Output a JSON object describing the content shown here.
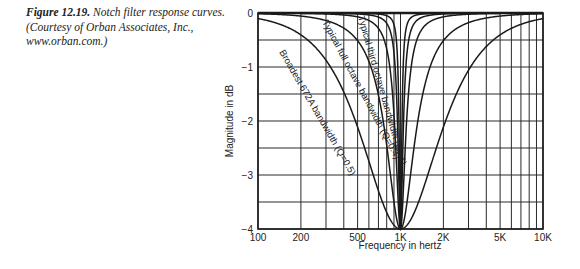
{
  "caption": {
    "figure_number": "Figure 12.19.",
    "text_line1": " Notch filter response curves.",
    "text_line2": "(Courtesy of Orban Associates, Inc.,",
    "text_line3": "www.orban.com.)"
  },
  "chart_data": {
    "type": "line",
    "title": "Notch filter response curves",
    "xlabel": "Frequency in hertz",
    "ylabel": "Magnitude in dB",
    "xscale": "log",
    "xlim": [
      100,
      10000
    ],
    "ylim": [
      -4,
      0
    ],
    "grid": true,
    "x_ticks": [
      {
        "value": 100,
        "label": "100"
      },
      {
        "value": 200,
        "label": "200"
      },
      {
        "value": 500,
        "label": "500"
      },
      {
        "value": 1000,
        "label": "1K"
      },
      {
        "value": 2000,
        "label": "2K"
      },
      {
        "value": 5000,
        "label": "5K"
      },
      {
        "value": 10000,
        "label": "10K"
      }
    ],
    "x_minor_grid": [
      300,
      400,
      600,
      700,
      800,
      900,
      3000,
      4000,
      6000,
      7000,
      8000,
      9000
    ],
    "y_ticks": [
      {
        "value": 0,
        "label": "0"
      },
      {
        "value": -1,
        "label": "−1"
      },
      {
        "value": -2,
        "label": "−2"
      },
      {
        "value": -3,
        "label": "−3"
      },
      {
        "value": -4,
        "label": "−4"
      }
    ],
    "y_minor_grid": [
      -0.5,
      -1.5,
      -2.5,
      -3.5
    ],
    "center_frequency": 1000,
    "notch_depth_db": -4,
    "series": [
      {
        "name": "Broadest 672A bandwidth (Q=0.5)",
        "q": 0.5,
        "label": "Broadest 672A bandwidth (Q=0.5)",
        "sample_points": [
          [
            100,
            -0.25
          ],
          [
            200,
            -0.9
          ],
          [
            300,
            -1.7
          ],
          [
            500,
            -2.9
          ],
          [
            1000,
            -4
          ],
          [
            2000,
            -2.9
          ],
          [
            5000,
            -1.0
          ],
          [
            10000,
            -0.25
          ]
        ]
      },
      {
        "name": "Typical full octave bandwidth (Q=0.4)",
        "q": 1.4,
        "label": "Typical full octave bandwidth (Q=0.4)",
        "sample_points": [
          [
            100,
            -0.02
          ],
          [
            200,
            -0.15
          ],
          [
            300,
            -0.4
          ],
          [
            500,
            -1.3
          ],
          [
            1000,
            -4
          ],
          [
            2000,
            -1.3
          ],
          [
            5000,
            -0.15
          ],
          [
            10000,
            -0.02
          ]
        ]
      },
      {
        "name": "Typical third octave bandwidth (Q=4)",
        "q": 4,
        "label": "Typical third octave bandwidth (Q=4)",
        "sample_points": [
          [
            500,
            -0.2
          ],
          [
            700,
            -0.6
          ],
          [
            900,
            -2.3
          ],
          [
            1000,
            -4
          ],
          [
            1100,
            -2.3
          ],
          [
            1500,
            -0.4
          ],
          [
            2000,
            -0.15
          ]
        ]
      },
      {
        "name": "Narrow notch (Q≈8)",
        "q": 8,
        "label": "",
        "sample_points": [
          [
            700,
            -0.15
          ],
          [
            900,
            -1.2
          ],
          [
            1000,
            -4
          ],
          [
            1100,
            -1.2
          ],
          [
            1500,
            -0.1
          ]
        ]
      },
      {
        "name": "Narrowest notch (Q≈16)",
        "q": 16,
        "label": "",
        "sample_points": [
          [
            800,
            -0.1
          ],
          [
            950,
            -1.3
          ],
          [
            1000,
            -4
          ],
          [
            1050,
            -1.3
          ],
          [
            1250,
            -0.1
          ]
        ]
      }
    ]
  },
  "colors": {
    "ink": "#1a1a1a",
    "grid": "#2a2a2a",
    "background": "#ffffff"
  }
}
